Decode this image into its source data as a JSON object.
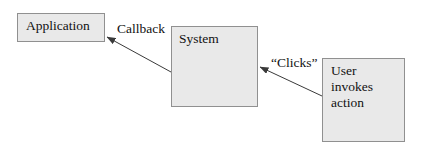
{
  "diagram": {
    "background_color": "#ffffff",
    "node_fill_color": "#e9e9e9",
    "node_border_color": "#909090",
    "text_color": "#111111",
    "nodes": [
      {
        "id": "application",
        "label": "Application",
        "x": 17,
        "y": 13,
        "width": 88,
        "height": 29
      },
      {
        "id": "system",
        "label": "System",
        "x": 171,
        "y": 26,
        "width": 87,
        "height": 81
      },
      {
        "id": "user",
        "label": "User\ninvokes\naction",
        "x": 322,
        "y": 58,
        "width": 83,
        "height": 84
      }
    ],
    "edges": [
      {
        "id": "callback",
        "label": "Callback",
        "from": "system",
        "to": "application",
        "x1": 171,
        "y1": 72,
        "x2": 107,
        "y2": 37,
        "arrow_at": "to"
      },
      {
        "id": "clicks",
        "label": "“Clicks”",
        "from": "user",
        "to": "system",
        "x1": 322,
        "y1": 96,
        "x2": 260,
        "y2": 67,
        "arrow_at": "to"
      }
    ]
  }
}
